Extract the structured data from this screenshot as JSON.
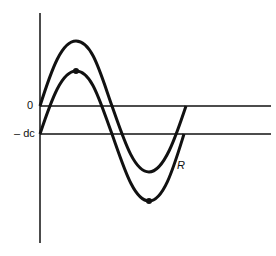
{
  "diagram": {
    "labels": {
      "zero": "0",
      "minus_dc": "– dc",
      "curve": "R"
    },
    "colors": {
      "line": "#111111",
      "background": "#ffffff"
    },
    "axis": {
      "x": 40,
      "top": 13,
      "bottom": 243
    },
    "baselines": [
      {
        "name": "zero",
        "y": 106,
        "x_end": 271
      },
      {
        "name": "minus_dc",
        "y": 134,
        "x_end": 271
      }
    ],
    "curves": [
      {
        "name": "upper-sine",
        "offset_y": 106,
        "amplitude": 65,
        "x_start": 40,
        "x_end": 186
      },
      {
        "name": "lower-sine-R",
        "offset_y": 134,
        "amplitude": 63,
        "x_start": 40,
        "x_end": 184,
        "markers": [
          "peak",
          "trough"
        ]
      }
    ]
  }
}
